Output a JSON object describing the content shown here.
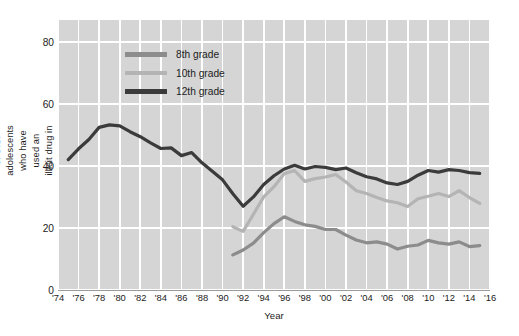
{
  "chart_data": {
    "type": "line",
    "title": "",
    "xlabel": "Year",
    "ylabel": "Trends in the percent of U.S. adolescents  who have used an illicit drug in the last 12 months",
    "xlim": [
      1974,
      2016
    ],
    "ylim": [
      0,
      87
    ],
    "yticks": [
      0,
      20,
      40,
      60,
      80
    ],
    "xticks": [
      1974,
      1976,
      1978,
      1980,
      1982,
      1984,
      1986,
      1988,
      1990,
      1992,
      1994,
      1996,
      1998,
      2000,
      2002,
      2004,
      2006,
      2008,
      2010,
      2012,
      2014,
      2016
    ],
    "xticklabels": [
      "'74",
      "'76",
      "'78",
      "'80",
      "'82",
      "'84",
      "'86",
      "'88",
      "'90",
      "'92",
      "'94",
      "'96",
      "'98",
      "'00",
      "'02",
      "'04",
      "'06",
      "'08",
      "'10",
      "'12",
      "'14",
      "'16"
    ],
    "grid": "both",
    "legend_position": "upper-left-inside",
    "background": "#d5d5d5",
    "gridline_color": "#ffffff",
    "series": [
      {
        "name": "8th grade",
        "color": "#8c8c8c",
        "x": [
          1991,
          1992,
          1993,
          1994,
          1995,
          1996,
          1997,
          1998,
          1999,
          2000,
          2001,
          2002,
          2003,
          2004,
          2005,
          2006,
          2007,
          2008,
          2009,
          2010,
          2011,
          2012,
          2013,
          2014,
          2015
        ],
        "values": [
          11.3,
          12.9,
          15.1,
          18.5,
          21.4,
          23.6,
          22.1,
          21.0,
          20.5,
          19.5,
          19.5,
          17.7,
          16.1,
          15.2,
          15.5,
          14.8,
          13.2,
          14.1,
          14.5,
          16.0,
          15.2,
          14.8,
          15.5,
          14.0,
          14.3
        ]
      },
      {
        "name": "10th grade",
        "color": "#b4b4b4",
        "x": [
          1991,
          1992,
          1993,
          1994,
          1995,
          1996,
          1997,
          1998,
          1999,
          2000,
          2001,
          2002,
          2003,
          2004,
          2005,
          2006,
          2007,
          2008,
          2009,
          2010,
          2011,
          2012,
          2013,
          2014,
          2015
        ],
        "values": [
          20.4,
          18.9,
          24.4,
          30.0,
          33.3,
          37.5,
          38.5,
          35.0,
          35.9,
          36.4,
          37.2,
          34.8,
          32.0,
          31.1,
          29.8,
          28.7,
          28.1,
          26.9,
          29.4,
          30.2,
          31.1,
          30.1,
          32.0,
          29.8,
          27.9
        ]
      },
      {
        "name": "12th grade",
        "color": "#3b3b3b",
        "x": [
          1975,
          1976,
          1977,
          1978,
          1979,
          1980,
          1981,
          1982,
          1983,
          1984,
          1985,
          1986,
          1987,
          1988,
          1989,
          1990,
          1991,
          1992,
          1993,
          1994,
          1995,
          1996,
          1997,
          1998,
          1999,
          2000,
          2001,
          2002,
          2003,
          2004,
          2005,
          2006,
          2007,
          2008,
          2009,
          2010,
          2011,
          2012,
          2013,
          2014,
          2015
        ],
        "values": [
          42.0,
          45.5,
          48.5,
          52.4,
          53.2,
          52.9,
          51.0,
          49.4,
          47.4,
          45.6,
          45.8,
          43.3,
          44.3,
          41.0,
          38.3,
          35.5,
          31.0,
          27.0,
          30.0,
          34.0,
          36.8,
          39.0,
          40.2,
          39.0,
          39.8,
          39.5,
          38.8,
          39.3,
          37.8,
          36.5,
          35.8,
          34.5,
          34.0,
          35.0,
          37.0,
          38.5,
          38.0,
          38.8,
          38.5,
          37.8,
          37.6
        ]
      }
    ]
  },
  "legend": {
    "items": [
      {
        "label": "8th grade",
        "color": "#8c8c8c"
      },
      {
        "label": "10th grade",
        "color": "#b4b4b4"
      },
      {
        "label": "12th grade",
        "color": "#3b3b3b"
      }
    ]
  }
}
